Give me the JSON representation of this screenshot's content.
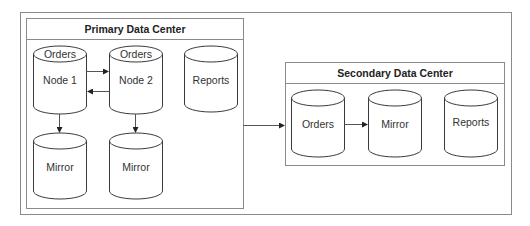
{
  "diagram": {
    "primary": {
      "title": "Primary Data Center",
      "node1": {
        "top": "Orders",
        "label": "Node 1"
      },
      "node2": {
        "top": "Orders",
        "label": "Node 2"
      },
      "reports": "Reports",
      "mirror1": "Mirror",
      "mirror2": "Mirror"
    },
    "secondary": {
      "title": "Secondary Data Center",
      "orders": "Orders",
      "mirror": "Mirror",
      "reports": "Reports"
    }
  }
}
